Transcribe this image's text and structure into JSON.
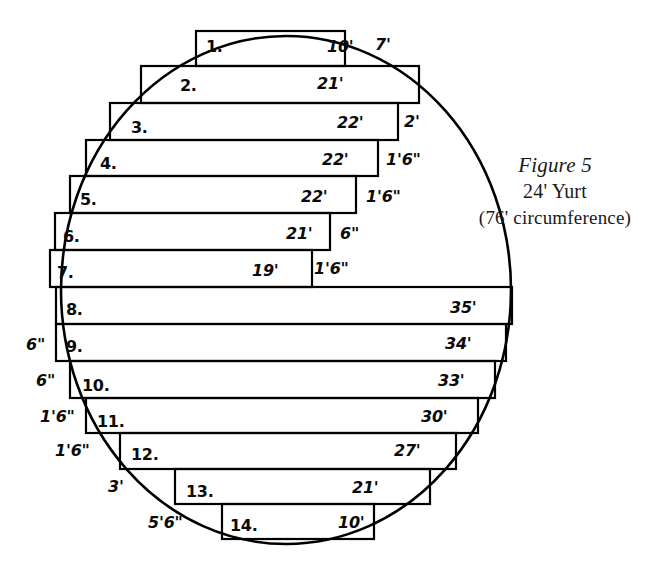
{
  "figure": {
    "caption_title": "Figure 5",
    "caption_subtitle": "24' Yurt",
    "caption_note": "(76' circumference)",
    "ink_color": "#000000",
    "background_color": "#ffffff"
  },
  "chart_data": {
    "type": "diagram",
    "xlabel": "",
    "ylabel": "",
    "grid": false,
    "legend": "none",
    "categories": [
      "1.",
      "2.",
      "3.",
      "4.",
      "5.",
      "6.",
      "7.",
      "8.",
      "9.",
      "10.",
      "11.",
      "12.",
      "13.",
      "14."
    ],
    "series": [
      {
        "name": "board length",
        "values": [
          "10'",
          "21'",
          "22'",
          "22'",
          "22'",
          "21'",
          "19'",
          "35'",
          "34'",
          "33'",
          "30'",
          "27'",
          "21'",
          "10'"
        ]
      }
    ],
    "right_offsets": [
      "7'",
      "2'",
      "1'6\"",
      "1'6\"",
      "6\"",
      "1'6\""
    ],
    "left_offsets": [
      "6\"",
      "6\"",
      "1'6\"",
      "1'6\"",
      "3'",
      "5'6\""
    ]
  },
  "rows": [
    {
      "number": "1.",
      "length": "10'",
      "nx": 206,
      "ny": 39,
      "lx": 327,
      "ly": 39
    },
    {
      "number": "2.",
      "length": "21'",
      "nx": 180,
      "ny": 78,
      "lx": 317,
      "ly": 76
    },
    {
      "number": "3.",
      "length": "22'",
      "nx": 131,
      "ny": 120,
      "lx": 337,
      "ly": 115
    },
    {
      "number": "4.",
      "length": "22'",
      "nx": 100,
      "ny": 156,
      "lx": 322,
      "ly": 152
    },
    {
      "number": "5.",
      "length": "22'",
      "nx": 80,
      "ny": 192,
      "lx": 301,
      "ly": 189
    },
    {
      "number": "6.",
      "length": "21'",
      "nx": 63,
      "ny": 229,
      "lx": 286,
      "ly": 226
    },
    {
      "number": "7.",
      "length": "19'",
      "nx": 57,
      "ny": 265,
      "lx": 252,
      "ly": 263
    },
    {
      "number": "8.",
      "length": "35'",
      "nx": 66,
      "ny": 302,
      "lx": 450,
      "ly": 300
    },
    {
      "number": "9.",
      "length": "34'",
      "nx": 66,
      "ny": 339,
      "lx": 445,
      "ly": 336
    },
    {
      "number": "10.",
      "length": "33'",
      "nx": 82,
      "ny": 378,
      "lx": 438,
      "ly": 373
    },
    {
      "number": "11.",
      "length": "30'",
      "nx": 97,
      "ny": 414,
      "lx": 421,
      "ly": 409
    },
    {
      "number": "12.",
      "length": "27'",
      "nx": 131,
      "ny": 447,
      "lx": 394,
      "ly": 443
    },
    {
      "number": "13.",
      "length": "21'",
      "nx": 186,
      "ny": 484,
      "lx": 352,
      "ly": 480
    },
    {
      "number": "14.",
      "length": "10'",
      "nx": 230,
      "ny": 518,
      "lx": 338,
      "ly": 515
    }
  ],
  "offsets": [
    {
      "text": "7'",
      "x": 375,
      "y": 37
    },
    {
      "text": "2'",
      "x": 404,
      "y": 114
    },
    {
      "text": "1'6\"",
      "x": 386,
      "y": 152
    },
    {
      "text": "1'6\"",
      "x": 366,
      "y": 189
    },
    {
      "text": "6\"",
      "x": 340,
      "y": 226
    },
    {
      "text": "1'6\"",
      "x": 314,
      "y": 261
    },
    {
      "text": "6\"",
      "x": 26,
      "y": 337
    },
    {
      "text": "6\"",
      "x": 36,
      "y": 373
    },
    {
      "text": "1'6\"",
      "x": 40,
      "y": 409
    },
    {
      "text": "1'6\"",
      "x": 55,
      "y": 443
    },
    {
      "text": "3'",
      "x": 108,
      "y": 479
    },
    {
      "text": "5'6\"",
      "x": 148,
      "y": 515
    }
  ],
  "geometry": {
    "boards": [
      {
        "id": 1,
        "x": 196,
        "y": 31,
        "w": 149,
        "h": 35
      },
      {
        "id": 2,
        "x": 141,
        "y": 66,
        "w": 278,
        "h": 37
      },
      {
        "id": 3,
        "x": 110,
        "y": 103,
        "w": 288,
        "h": 37
      },
      {
        "id": 4,
        "x": 86,
        "y": 140,
        "w": 292,
        "h": 36
      },
      {
        "id": 5,
        "x": 70,
        "y": 176,
        "w": 286,
        "h": 37
      },
      {
        "id": 6,
        "x": 55,
        "y": 213,
        "w": 275,
        "h": 37
      },
      {
        "id": 7,
        "x": 50,
        "y": 250,
        "w": 262,
        "h": 37
      },
      {
        "id": 8,
        "x": 56,
        "y": 287,
        "w": 456,
        "h": 37
      },
      {
        "id": 9,
        "x": 56,
        "y": 324,
        "w": 450,
        "h": 37
      },
      {
        "id": 10,
        "x": 70,
        "y": 361,
        "w": 425,
        "h": 37
      },
      {
        "id": 11,
        "x": 86,
        "y": 398,
        "w": 392,
        "h": 35
      },
      {
        "id": 12,
        "x": 120,
        "y": 433,
        "w": 336,
        "h": 36
      },
      {
        "id": 13,
        "x": 175,
        "y": 469,
        "w": 255,
        "h": 35
      },
      {
        "id": 14,
        "x": 222,
        "y": 504,
        "w": 152,
        "h": 35
      }
    ],
    "circle": {
      "cx": 286,
      "cy": 290,
      "rx": 225,
      "ry": 254
    }
  }
}
